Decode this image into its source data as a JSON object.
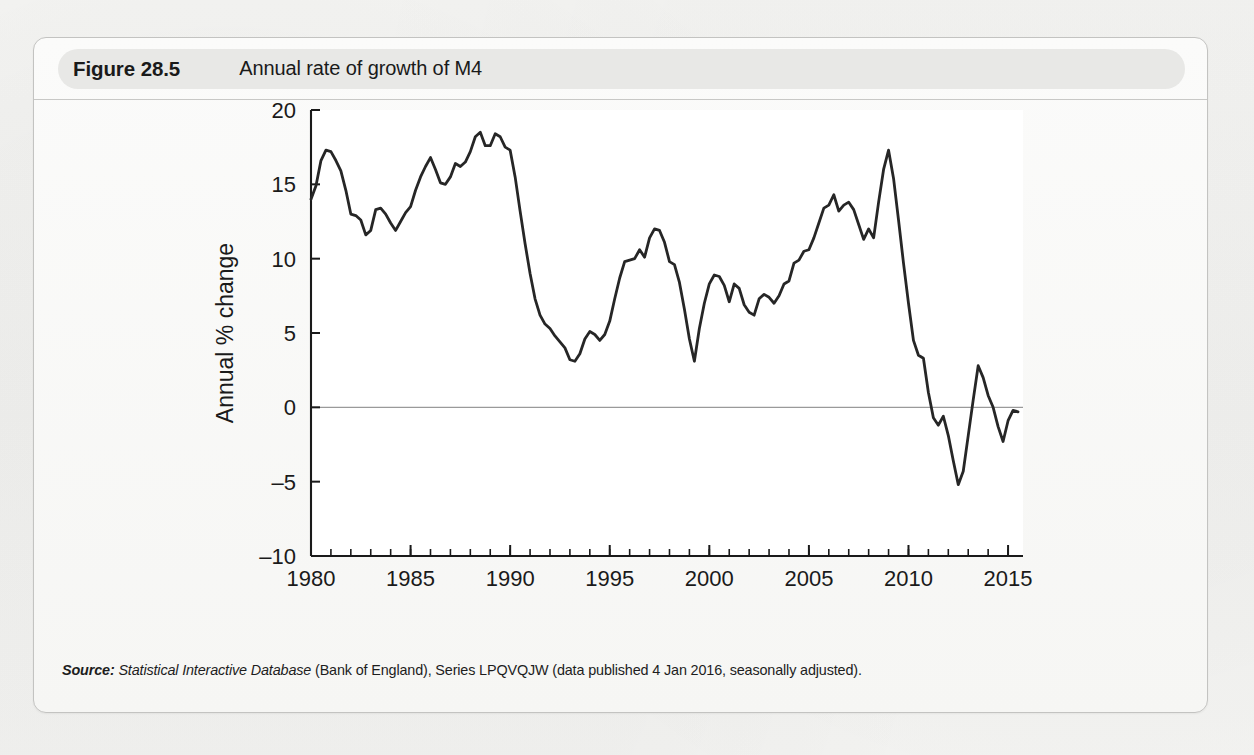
{
  "figure": {
    "number": "Figure 28.5",
    "title": "Annual rate of growth of M4"
  },
  "source": {
    "label": "Source:",
    "database": "Statistical Interactive Database",
    "rest": "(Bank of England), Series LPQVQJW (data published 4 Jan 2016, seasonally adjusted)."
  },
  "colors": {
    "line": "#262626",
    "axis": "#1a1a1a",
    "zero_line": "#9a9a9a",
    "plot_background": "#ffffff",
    "pill": "#e8e8e6",
    "frame_border": "#c3c3c1",
    "page": "#f2f2f0"
  },
  "chart_data": {
    "type": "line",
    "title": "Annual rate of growth of M4",
    "xlabel": "",
    "ylabel": "Annual % change",
    "xlim": [
      1980,
      2015.75
    ],
    "ylim": [
      -10,
      20
    ],
    "xticks": [
      1980,
      1985,
      1990,
      1995,
      2000,
      2005,
      2010,
      2015
    ],
    "xtick_labels": [
      "1980",
      "1985",
      "1990",
      "1995",
      "2000",
      "2005",
      "2010",
      "2015"
    ],
    "yticks": [
      20,
      15,
      10,
      5,
      0,
      -5,
      -10
    ],
    "ytick_labels": [
      "20",
      "15",
      "10",
      "5",
      "0",
      "–5",
      "–10"
    ],
    "minor_xtick_interval": 1,
    "grid": false,
    "legend": null,
    "zero_reference_line": 0,
    "series": [
      {
        "name": "M4 annual % change",
        "color": "#262626",
        "x": [
          1980.0,
          1980.25,
          1980.5,
          1980.75,
          1981.0,
          1981.25,
          1981.5,
          1981.75,
          1982.0,
          1982.25,
          1982.5,
          1982.75,
          1983.0,
          1983.25,
          1983.5,
          1983.75,
          1984.0,
          1984.25,
          1984.5,
          1984.75,
          1985.0,
          1985.25,
          1985.5,
          1985.75,
          1986.0,
          1986.25,
          1986.5,
          1986.75,
          1987.0,
          1987.25,
          1987.5,
          1987.75,
          1988.0,
          1988.25,
          1988.5,
          1988.75,
          1989.0,
          1989.25,
          1989.5,
          1989.75,
          1990.0,
          1990.25,
          1990.5,
          1990.75,
          1991.0,
          1991.25,
          1991.5,
          1991.75,
          1992.0,
          1992.25,
          1992.5,
          1992.75,
          1993.0,
          1993.25,
          1993.5,
          1993.75,
          1994.0,
          1994.25,
          1994.5,
          1994.75,
          1995.0,
          1995.25,
          1995.5,
          1995.75,
          1996.0,
          1996.25,
          1996.5,
          1996.75,
          1997.0,
          1997.25,
          1997.5,
          1997.75,
          1998.0,
          1998.25,
          1998.5,
          1998.75,
          1999.0,
          1999.25,
          1999.5,
          1999.75,
          2000.0,
          2000.25,
          2000.5,
          2000.75,
          2001.0,
          2001.25,
          2001.5,
          2001.75,
          2002.0,
          2002.25,
          2002.5,
          2002.75,
          2003.0,
          2003.25,
          2003.5,
          2003.75,
          2004.0,
          2004.25,
          2004.5,
          2004.75,
          2005.0,
          2005.25,
          2005.5,
          2005.75,
          2006.0,
          2006.25,
          2006.5,
          2006.75,
          2007.0,
          2007.25,
          2007.5,
          2007.75,
          2008.0,
          2008.25,
          2008.5,
          2008.75,
          2009.0,
          2009.25,
          2009.5,
          2009.75,
          2010.0,
          2010.25,
          2010.5,
          2010.75,
          2011.0,
          2011.25,
          2011.5,
          2011.75,
          2012.0,
          2012.25,
          2012.5,
          2012.75,
          2013.0,
          2013.25,
          2013.5,
          2013.75,
          2014.0,
          2014.25,
          2014.5,
          2014.75,
          2015.0,
          2015.25,
          2015.5
        ],
        "y": [
          14.0,
          14.9,
          16.6,
          17.3,
          17.2,
          16.6,
          15.9,
          14.6,
          13.0,
          12.9,
          12.6,
          11.6,
          11.9,
          13.3,
          13.4,
          13.0,
          12.4,
          11.9,
          12.5,
          13.1,
          13.5,
          14.6,
          15.5,
          16.2,
          16.8,
          16.0,
          15.1,
          15.0,
          15.5,
          16.4,
          16.2,
          16.5,
          17.2,
          18.2,
          18.5,
          17.6,
          17.6,
          18.4,
          18.2,
          17.5,
          17.3,
          15.5,
          13.2,
          11.0,
          9.0,
          7.3,
          6.2,
          5.6,
          5.3,
          4.8,
          4.4,
          4.0,
          3.2,
          3.1,
          3.6,
          4.6,
          5.1,
          4.9,
          4.5,
          4.9,
          5.8,
          7.3,
          8.7,
          9.8,
          9.9,
          10.0,
          10.6,
          10.1,
          11.4,
          12.0,
          11.9,
          11.1,
          9.8,
          9.6,
          8.4,
          6.6,
          4.6,
          3.1,
          5.3,
          7.0,
          8.3,
          8.9,
          8.8,
          8.2,
          7.1,
          8.3,
          8.0,
          6.9,
          6.4,
          6.2,
          7.3,
          7.6,
          7.4,
          7.0,
          7.5,
          8.3,
          8.5,
          9.7,
          9.9,
          10.5,
          10.6,
          11.4,
          12.4,
          13.4,
          13.6,
          14.3,
          13.2,
          13.6,
          13.8,
          13.3,
          12.3,
          11.3,
          12.0,
          11.4,
          13.8,
          16.0,
          17.3,
          15.4,
          12.6,
          9.7,
          7.0,
          4.5,
          3.5,
          3.3,
          1.0,
          -0.7,
          -1.2,
          -0.6,
          -1.9,
          -3.6,
          -5.2,
          -4.3,
          -1.9,
          0.5,
          2.8,
          2.0,
          0.8,
          0.0,
          -1.3,
          -2.3,
          -0.9,
          -0.2,
          -0.3
        ]
      }
    ]
  }
}
